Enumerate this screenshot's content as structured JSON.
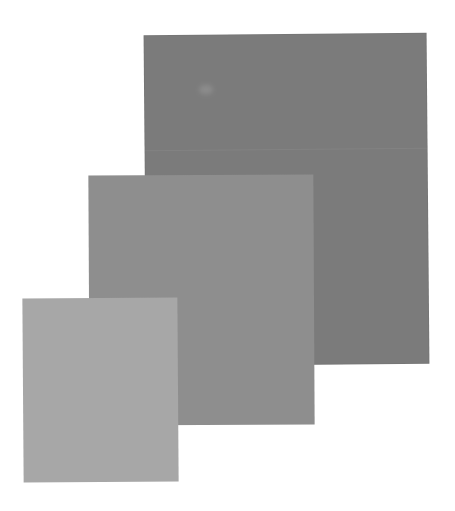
{
  "swatches": [
    {
      "id": "large",
      "color": "#7b7b7b"
    },
    {
      "id": "medium",
      "color": "#8e8e8e"
    },
    {
      "id": "small",
      "color": "#a7a7a7"
    }
  ],
  "background": "#ffffff"
}
